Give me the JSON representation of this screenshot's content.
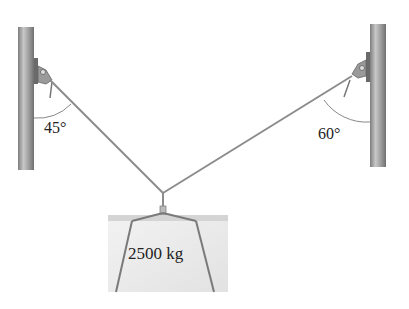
{
  "diagram": {
    "left_angle": "45°",
    "right_angle": "60°",
    "mass_label": "2500 kg",
    "components": [
      "left-pole",
      "right-pole",
      "left-cable",
      "right-cable",
      "hook",
      "crate"
    ]
  },
  "colors": {
    "pole": "#9a9a9a",
    "cable": "#8c8c8c",
    "crate_face": "#ececec",
    "crate_top": "#d4d4d4",
    "text": "#222222"
  }
}
